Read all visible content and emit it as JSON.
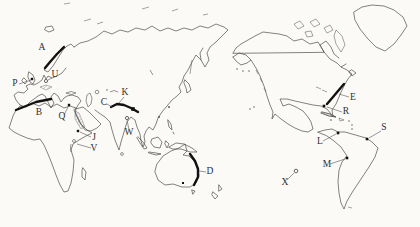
{
  "map": {
    "description": "Hand-drawn outline world map (Pacific-centered) quiz sheet with lettered location markers, thick strokes for mountain ranges, squares/dots for cities and circles for islands",
    "colors": {
      "background": "#fbfaf7",
      "coastline": "#4d4d4d",
      "range_stroke": "#111111",
      "label": "#2f2f2f"
    },
    "labels": [
      {
        "id": "A",
        "x": 42,
        "y": 50
      },
      {
        "id": "P",
        "x": 15,
        "y": 86
      },
      {
        "id": "U",
        "x": 55,
        "y": 77
      },
      {
        "id": "B",
        "x": 39,
        "y": 115
      },
      {
        "id": "Q",
        "x": 62,
        "y": 119
      },
      {
        "id": "C",
        "x": 104,
        "y": 105
      },
      {
        "id": "K",
        "x": 125,
        "y": 95
      },
      {
        "id": "W",
        "x": 129,
        "y": 135
      },
      {
        "id": "J",
        "x": 94,
        "y": 140
      },
      {
        "id": "V",
        "x": 94,
        "y": 151
      },
      {
        "id": "D",
        "x": 210,
        "y": 174
      },
      {
        "id": "X",
        "x": 285,
        "y": 185
      },
      {
        "id": "E",
        "x": 353,
        "y": 100
      },
      {
        "id": "R",
        "x": 346,
        "y": 114
      },
      {
        "id": "L",
        "x": 320,
        "y": 144
      },
      {
        "id": "M",
        "x": 327,
        "y": 167
      },
      {
        "id": "S",
        "x": 384,
        "y": 130
      }
    ],
    "leaders": [
      {
        "label": "P",
        "x1": 19,
        "y1": 84,
        "x2": 31,
        "y2": 80
      },
      {
        "label": "U",
        "x1": 52,
        "y1": 78,
        "x2": 48,
        "y2": 80
      },
      {
        "label": "Q",
        "x1": 64,
        "y1": 115,
        "x2": 68,
        "y2": 107
      },
      {
        "label": "C",
        "x1": 107,
        "y1": 104,
        "x2": 112,
        "y2": 107
      },
      {
        "label": "K",
        "x1": 124,
        "y1": 97,
        "x2": 119,
        "y2": 103
      },
      {
        "label": "W",
        "x1": 129,
        "y1": 130,
        "x2": 127,
        "y2": 120
      },
      {
        "label": "J",
        "x1": 91,
        "y1": 137,
        "x2": 80,
        "y2": 132
      },
      {
        "label": "V",
        "x1": 91,
        "y1": 148,
        "x2": 77,
        "y2": 144
      },
      {
        "label": "D",
        "x1": 206,
        "y1": 172,
        "x2": 199,
        "y2": 171
      },
      {
        "label": "X",
        "x1": 287,
        "y1": 180,
        "x2": 294,
        "y2": 173
      },
      {
        "label": "E",
        "x1": 349,
        "y1": 97,
        "x2": 339,
        "y2": 94
      },
      {
        "label": "R",
        "x1": 342,
        "y1": 112,
        "x2": 327,
        "y2": 107
      },
      {
        "label": "L",
        "x1": 323,
        "y1": 141,
        "x2": 336,
        "y2": 134
      },
      {
        "label": "M",
        "x1": 330,
        "y1": 164,
        "x2": 345,
        "y2": 159
      },
      {
        "label": "S",
        "x1": 381,
        "y1": 131,
        "x2": 369,
        "y2": 138
      }
    ],
    "ranges": [
      {
        "id": "A",
        "points": [
          [
            45,
            68
          ],
          [
            50,
            62
          ],
          [
            57,
            54
          ],
          [
            64,
            47
          ]
        ]
      },
      {
        "id": "B",
        "points": [
          [
            16,
            110
          ],
          [
            26,
            106
          ],
          [
            36,
            102
          ],
          [
            46,
            100
          ],
          [
            51,
            99
          ]
        ]
      },
      {
        "id": "C",
        "points": [
          [
            111,
            107
          ],
          [
            117,
            104
          ],
          [
            124,
            105
          ],
          [
            131,
            108
          ],
          [
            138,
            112
          ]
        ]
      },
      {
        "id": "D",
        "points": [
          [
            190,
            154
          ],
          [
            195,
            161
          ],
          [
            198,
            169
          ],
          [
            198,
            177
          ],
          [
            194,
            185
          ]
        ]
      },
      {
        "id": "E",
        "points": [
          [
            327,
            104
          ],
          [
            333,
            97
          ],
          [
            338,
            91
          ],
          [
            344,
            84
          ]
        ]
      }
    ],
    "markers": [
      {
        "shape": "square",
        "x": 32,
        "y": 79,
        "size": 2.4,
        "for": "P"
      },
      {
        "shape": "circle",
        "x": 46,
        "y": 81,
        "r": 1.6,
        "for": "U"
      },
      {
        "shape": "square",
        "x": 69,
        "y": 105,
        "size": 2.4,
        "for": "Q"
      },
      {
        "shape": "square",
        "x": 78,
        "y": 131,
        "size": 2.4,
        "for": "J"
      },
      {
        "shape": "circle",
        "x": 127,
        "y": 118,
        "r": 1.6,
        "for": "W"
      },
      {
        "shape": "square",
        "x": 133,
        "y": 109,
        "size": 3.6,
        "for": "C"
      },
      {
        "shape": "square",
        "x": 183,
        "y": 183,
        "size": 2.0,
        "for": "D"
      },
      {
        "shape": "circle",
        "x": 296,
        "y": 171,
        "r": 1.8,
        "for": "X"
      },
      {
        "shape": "square",
        "x": 324,
        "y": 106,
        "size": 2.6,
        "for": "R"
      },
      {
        "shape": "square",
        "x": 338,
        "y": 133,
        "size": 2.6,
        "for": "L"
      },
      {
        "shape": "square",
        "x": 347,
        "y": 158,
        "size": 2.6,
        "for": "M"
      },
      {
        "shape": "square",
        "x": 367,
        "y": 139,
        "size": 2.6,
        "for": "S"
      }
    ]
  }
}
